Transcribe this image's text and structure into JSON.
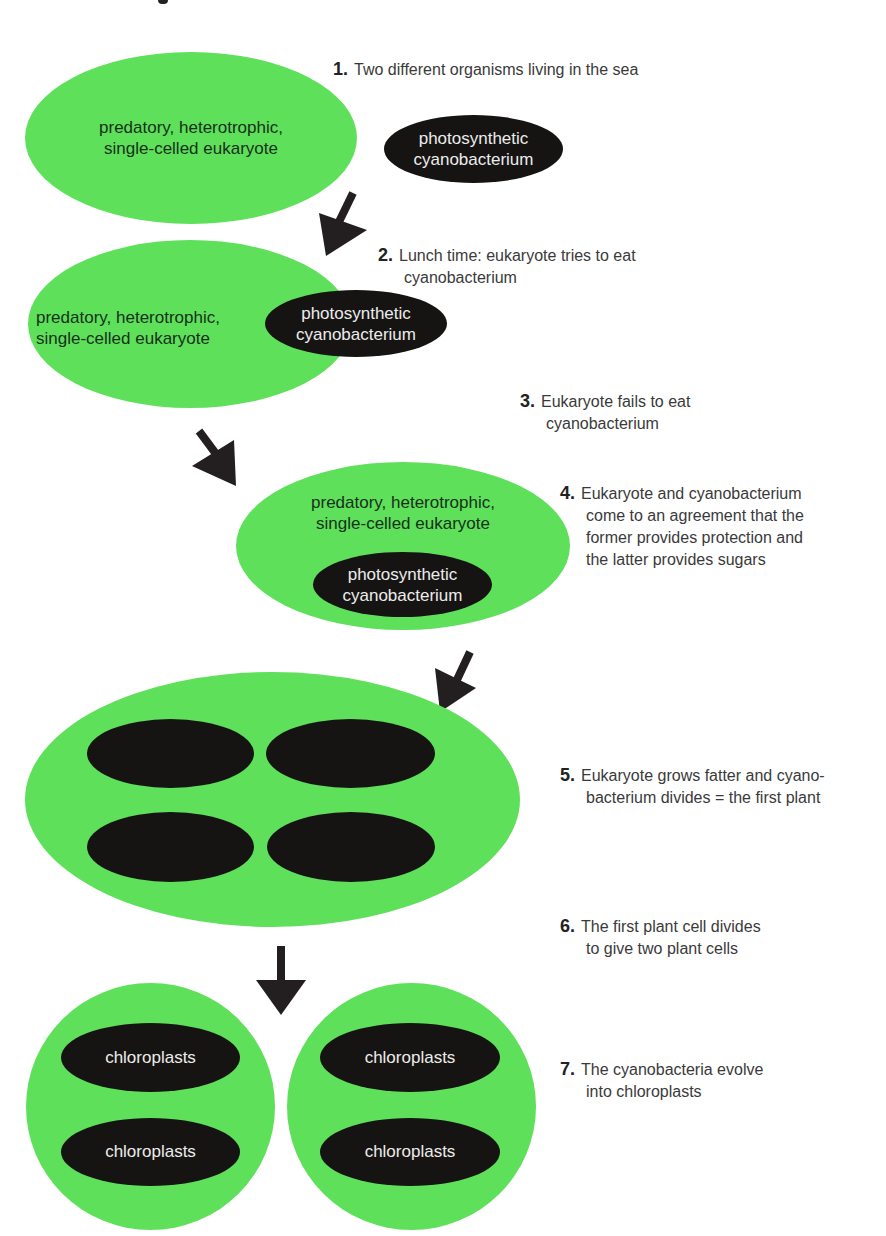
{
  "colors": {
    "cell_green": "#5ee05a",
    "cyanobacterium_dark": "#161412",
    "arrow": "#231f20",
    "step_text": "#3a3a3a"
  },
  "labels": {
    "eukaryote": [
      "predatory, heterotrophic,",
      "single-celled eukaryote"
    ],
    "cyanobacterium": [
      "photosynthetic",
      "cyanobacterium"
    ],
    "chloroplast": "chloroplasts"
  },
  "steps": [
    {
      "num": "1.",
      "lines": [
        "Two different organisms living in the sea"
      ]
    },
    {
      "num": "2.",
      "lines": [
        "Lunch time: eukaryote tries to eat",
        "cyanobacterium"
      ]
    },
    {
      "num": "3.",
      "lines": [
        "Eukaryote fails to eat",
        "cyanobacterium"
      ]
    },
    {
      "num": "4.",
      "lines": [
        "Eukaryote and cyanobacterium",
        "come to an agreement that the",
        "former provides protection and",
        "the latter provides sugars"
      ]
    },
    {
      "num": "5.",
      "lines": [
        "Eukaryote grows fatter and cyano-",
        "bacterium divides = the first plant"
      ]
    },
    {
      "num": "6.",
      "lines": [
        "The first plant cell divides",
        "to give two plant cells"
      ]
    },
    {
      "num": "7.",
      "lines": [
        "The cyanobacteria evolve",
        "into chloroplasts"
      ]
    }
  ],
  "arrows": [
    {
      "name": "arrow-step1-to-step2",
      "direction": "down-left"
    },
    {
      "name": "arrow-step2-to-step4",
      "direction": "down-right"
    },
    {
      "name": "arrow-step4-to-step5",
      "direction": "down-left"
    },
    {
      "name": "arrow-step5-to-step6",
      "direction": "down"
    }
  ]
}
